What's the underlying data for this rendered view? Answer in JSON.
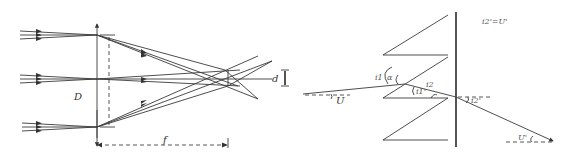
{
  "left_figure": {
    "title": "Lens focusing three parallel ray bundles",
    "labels": {
      "aperture": "D",
      "focal_length": "f",
      "spot_size": "d"
    }
  },
  "right_figure": {
    "title": "Sawtooth prism refraction",
    "labels": {
      "equation": "i2'=U'",
      "incident_angle": "i1",
      "alpha": "α",
      "refracted_1": "i1'",
      "incident_2": "i2",
      "refracted_2": "i2'",
      "input_angle": "U",
      "output_angle": "U'"
    }
  }
}
